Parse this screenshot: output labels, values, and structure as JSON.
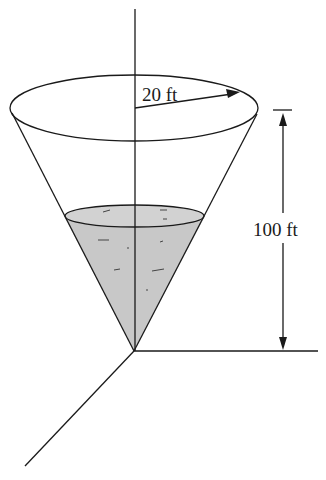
{
  "figure": {
    "labels": {
      "radius": "20 ft",
      "height": "100 ft"
    },
    "colors": {
      "line": "#1a1a1a",
      "water": "#c8c8c8",
      "background": "#ffffff"
    }
  }
}
